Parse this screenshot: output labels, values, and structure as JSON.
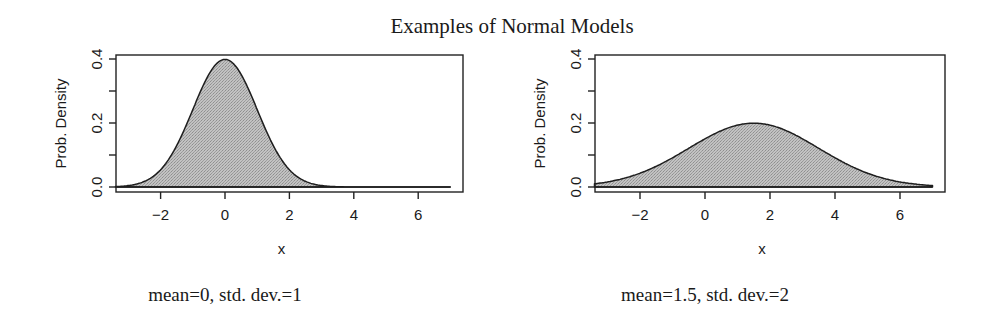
{
  "figure": {
    "title": "Examples of Normal Models"
  },
  "chart_data": [
    {
      "type": "area",
      "title": "",
      "caption": "mean=0, std. dev.=1",
      "xlabel": "x",
      "ylabel": "Prob. Density",
      "distribution": "normal",
      "mean": 0,
      "sd": 1,
      "xlim": [
        -3.4,
        7.4
      ],
      "ylim": [
        0,
        0.41
      ],
      "curve_x_range": [
        -3.4,
        7.0
      ],
      "x_ticks": [
        -2,
        0,
        2,
        4,
        6
      ],
      "x_tick_labels": [
        "−2",
        "0",
        "2",
        "4",
        "6"
      ],
      "y_ticks": [
        0.0,
        0.1,
        0.2,
        0.3,
        0.4
      ],
      "y_tick_labels": [
        "0.0",
        "",
        "0.2",
        "",
        "0.4"
      ],
      "peak": {
        "x": 0,
        "y": 0.399
      },
      "fill": "#b9b9b9",
      "grid": false,
      "legend": null
    },
    {
      "type": "area",
      "title": "",
      "caption": "mean=1.5, std. dev.=2",
      "xlabel": "x",
      "ylabel": "Prob. Density",
      "distribution": "normal",
      "mean": 1.5,
      "sd": 2,
      "xlim": [
        -3.4,
        7.4
      ],
      "ylim": [
        0,
        0.41
      ],
      "curve_x_range": [
        -3.4,
        7.0
      ],
      "x_ticks": [
        -2,
        0,
        2,
        4,
        6
      ],
      "x_tick_labels": [
        "−2",
        "0",
        "2",
        "4",
        "6"
      ],
      "y_ticks": [
        0.0,
        0.1,
        0.2,
        0.3,
        0.4
      ],
      "y_tick_labels": [
        "0.0",
        "",
        "0.2",
        "",
        "0.4"
      ],
      "peak": {
        "x": 1.5,
        "y": 0.199
      },
      "fill": "#b9b9b9",
      "grid": false,
      "legend": null
    }
  ],
  "layout": {
    "panels": [
      {
        "box": {
          "left": 116,
          "top": 55,
          "right": 463,
          "bottom": 192
        },
        "x0_px": 225,
        "px_per_x": 32.2,
        "y0_px": 187,
        "px_per_y": 320,
        "ylabel_x": 66,
        "caption_x": 225,
        "caption_y": 301
      },
      {
        "box": {
          "left": 595,
          "top": 55,
          "right": 945,
          "bottom": 192
        },
        "x0_px": 705,
        "px_per_x": 32.5,
        "y0_px": 187,
        "px_per_y": 320,
        "ylabel_x": 545,
        "caption_x": 705,
        "caption_y": 301
      }
    ]
  }
}
